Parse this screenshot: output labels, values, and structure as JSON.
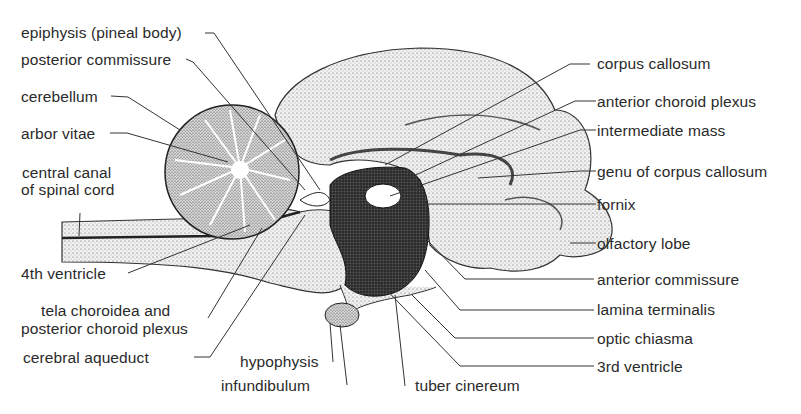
{
  "figure": {
    "background": "#ffffff",
    "ink": "#2a2a2a"
  },
  "labels": {
    "left": [
      {
        "id": "epiphysis",
        "text": "epiphysis (pineal body)"
      },
      {
        "id": "posterior_commissure",
        "text": "posterior commissure"
      },
      {
        "id": "cerebellum",
        "text": "cerebellum"
      },
      {
        "id": "arbor_vitae",
        "text": "arbor vitae"
      },
      {
        "id": "central_canal_1",
        "text": "central canal"
      },
      {
        "id": "central_canal_2",
        "text": "of spinal cord"
      },
      {
        "id": "fourth_ventricle",
        "text": "4th ventricle"
      },
      {
        "id": "tela_1",
        "text": "tela choroidea and"
      },
      {
        "id": "tela_2",
        "text": "posterior choroid plexus"
      },
      {
        "id": "cerebral_aqueduct",
        "text": "cerebral aqueduct"
      }
    ],
    "bottom": [
      {
        "id": "hypophysis",
        "text": "hypophysis"
      },
      {
        "id": "infundibulum",
        "text": "infundibulum"
      },
      {
        "id": "tuber_cinereum",
        "text": "tuber cinereum"
      }
    ],
    "right": [
      {
        "id": "corpus_callosum",
        "text": "corpus callosum"
      },
      {
        "id": "anterior_choroid_plexus",
        "text": "anterior choroid plexus"
      },
      {
        "id": "intermediate_mass",
        "text": "intermediate mass"
      },
      {
        "id": "genu",
        "text": "genu of corpus callosum"
      },
      {
        "id": "fornix",
        "text": "fornix"
      },
      {
        "id": "olfactory_lobe",
        "text": "olfactory lobe"
      },
      {
        "id": "anterior_commissure",
        "text": "anterior commissure"
      },
      {
        "id": "lamina_terminalis",
        "text": "lamina terminalis"
      },
      {
        "id": "optic_chiasma",
        "text": "optic chiasma"
      },
      {
        "id": "third_ventricle",
        "text": "3rd ventricle"
      }
    ]
  }
}
